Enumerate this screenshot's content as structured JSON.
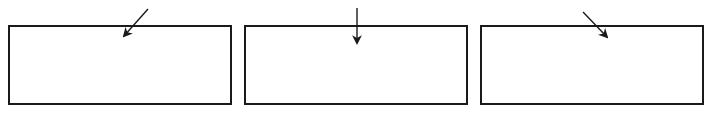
{
  "diagram": {
    "title": "",
    "stroke_color": "#1a1a1a",
    "background": "#ffffff",
    "panels": [
      {
        "id": "panel-1",
        "box": {
          "left": 8,
          "top": 25,
          "right": 231,
          "bottom": 104
        },
        "arrow": {
          "direction": "down-left",
          "from": [
            148,
            9
          ],
          "to": [
            123,
            37
          ]
        }
      },
      {
        "id": "panel-2",
        "box": {
          "left": 244,
          "top": 25,
          "right": 467,
          "bottom": 104
        },
        "arrow": {
          "direction": "down",
          "from": [
            357,
            8
          ],
          "to": [
            357,
            44
          ]
        }
      },
      {
        "id": "panel-3",
        "box": {
          "left": 480,
          "top": 25,
          "right": 703,
          "bottom": 104
        },
        "arrow": {
          "direction": "down-right",
          "from": [
            583,
            12
          ],
          "to": [
            608,
            38
          ]
        }
      }
    ]
  }
}
